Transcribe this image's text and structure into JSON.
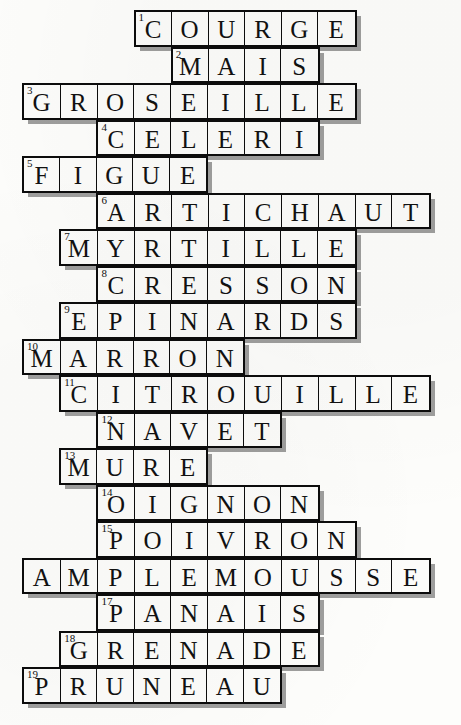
{
  "puzzle": {
    "title": "Crossword grid of French fruits and vegetables",
    "type": "crossword",
    "columns": 12,
    "rows": 19,
    "cell_width": 37.2,
    "cell_height": 36.5,
    "origin_x": 22,
    "origin_y": 10,
    "ink_color": "#0c0c0c",
    "paper_color": "#fdfdfb",
    "cell_color": "#fcfcfa",
    "shadow_color": "#808080",
    "entries": [
      {
        "number": "1",
        "answer": "COURGE",
        "row": 1,
        "col": 3,
        "length": 6
      },
      {
        "number": "2",
        "answer": "MAIS",
        "row": 2,
        "col": 4,
        "length": 4
      },
      {
        "number": "3",
        "answer": "GROSEILLE",
        "row": 3,
        "col": 0,
        "length": 9
      },
      {
        "number": "4",
        "answer": "CELERI",
        "row": 4,
        "col": 2,
        "length": 6
      },
      {
        "number": "5",
        "answer": "FIGUE",
        "row": 5,
        "col": 0,
        "length": 5
      },
      {
        "number": "6",
        "answer": "ARTICHAUT",
        "row": 6,
        "col": 2,
        "length": 9
      },
      {
        "number": "7",
        "answer": "MYRTILLE",
        "row": 7,
        "col": 1,
        "length": 8
      },
      {
        "number": "8",
        "answer": "CRESSON",
        "row": 8,
        "col": 2,
        "length": 7
      },
      {
        "number": "9",
        "answer": "EPINARDS",
        "row": 9,
        "col": 1,
        "length": 8
      },
      {
        "number": "10",
        "answer": "MARRON",
        "row": 10,
        "col": 0,
        "length": 6
      },
      {
        "number": "11",
        "answer": "CITROUILLE",
        "row": 11,
        "col": 1,
        "length": 10
      },
      {
        "number": "12",
        "answer": "NAVET",
        "row": 12,
        "col": 2,
        "length": 5
      },
      {
        "number": "13",
        "answer": "MURE",
        "row": 13,
        "col": 1,
        "length": 4
      },
      {
        "number": "14",
        "answer": "OIGNON",
        "row": 14,
        "col": 2,
        "length": 6
      },
      {
        "number": "15",
        "answer": "POIVRON",
        "row": 15,
        "col": 2,
        "length": 7
      },
      {
        "number": "",
        "answer": "AMPLEMOUSSE",
        "row": 16,
        "col": 0,
        "length": 11
      },
      {
        "number": "17",
        "answer": "PANAIS",
        "row": 17,
        "col": 2,
        "length": 6
      },
      {
        "number": "18",
        "answer": "GRENADE",
        "row": 18,
        "col": 1,
        "length": 7
      },
      {
        "number": "19",
        "answer": "PRUNEAU",
        "row": 19,
        "col": 0,
        "length": 7
      }
    ]
  }
}
